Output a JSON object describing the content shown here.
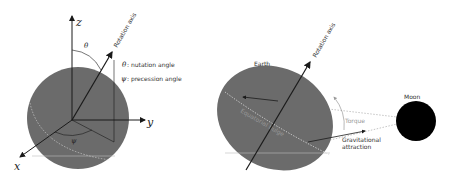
{
  "left_panel": {
    "axes": {
      "x": "x",
      "y": "y",
      "z": "z"
    },
    "rotation_axis_label": "Rotation axis",
    "theta_symbol": "θ",
    "psi_symbol": "ψ",
    "legend": [
      {
        "symbol": "θ",
        "text": ": nutation angle"
      },
      {
        "symbol": "ψ",
        "text": ": precession angle"
      }
    ]
  },
  "right_panel": {
    "earth_label": "Earth",
    "rotation_axis_label": "Rotation axis",
    "equatorial_bulge_label": "Equatorial bulge",
    "moon_label": "Moon",
    "torque_label": "Torque",
    "gravity_label_line1": "Gravitational",
    "gravity_label_line2": "attraction"
  },
  "colors": {
    "sphere": "#6b6b6b",
    "moon": "#000000",
    "arrow": "#1a1a1a",
    "light_line": "#bdbdbd",
    "torque": "#9a9a9a"
  }
}
